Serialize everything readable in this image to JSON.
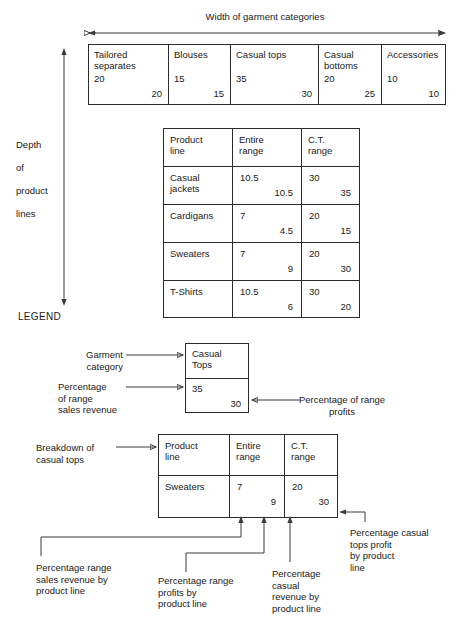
{
  "diagram": {
    "title_top": "Width of garment categories",
    "axis_label_left": [
      "Depth",
      "of",
      "product",
      "lines"
    ],
    "legend_title": "LEGEND"
  },
  "garment_table": {
    "columns": [
      {
        "name": "Tailored\nseparates",
        "sales_pct": "20",
        "profit_pct": "20"
      },
      {
        "name": "Blouses",
        "sales_pct": "15",
        "profit_pct": "15"
      },
      {
        "name": "Casual tops",
        "sales_pct": "35",
        "profit_pct": "30"
      },
      {
        "name": "Casual\nbottoms",
        "sales_pct": "20",
        "profit_pct": "25"
      },
      {
        "name": "Accessories",
        "sales_pct": "10",
        "profit_pct": "10"
      }
    ]
  },
  "product_table": {
    "headers": [
      "Product\nline",
      "Entire\nrange",
      "C.T.\nrange"
    ],
    "rows": [
      {
        "line": "Casual\njackets",
        "entire_tl": "10.5",
        "entire_br": "10.5",
        "ct_tl": "30",
        "ct_br": "35"
      },
      {
        "line": "Cardigans",
        "entire_tl": "7",
        "entire_br": "4.5",
        "ct_tl": "20",
        "ct_br": "15"
      },
      {
        "line": "Sweaters",
        "entire_tl": "7",
        "entire_br": "9",
        "ct_tl": "20",
        "ct_br": "30"
      },
      {
        "line": "T-Shirts",
        "entire_tl": "10.5",
        "entire_br": "6",
        "ct_tl": "30",
        "ct_br": "20"
      }
    ]
  },
  "legend_sample": {
    "category": "Casual\nTops",
    "sales_pct": "35",
    "profit_pct": "30",
    "callouts": {
      "category": "Garment\ncategory",
      "sales": "Percentage\nof range\nsales revenue",
      "profits": "Percentage of range\nprofits"
    }
  },
  "legend_breakdown": {
    "callout": "Breakdown of\ncasual tops",
    "headers": [
      "Product\nline",
      "Entire\nrange",
      "C.T.\nrange"
    ],
    "row": {
      "line": "Sweaters",
      "entire_tl": "7",
      "entire_br": "9",
      "ct_tl": "20",
      "ct_br": "30"
    },
    "callouts": {
      "range_sales": "Percentage range\nsales revenue by\nproduct line",
      "range_profits": "Percentage range\nprofits by\nproduct line",
      "casual_revenue": "Percentage\ncasual\nrevenue by\nproduct line",
      "casual_profit": "Percentage casual\ntops profit\nby product\nline"
    }
  }
}
